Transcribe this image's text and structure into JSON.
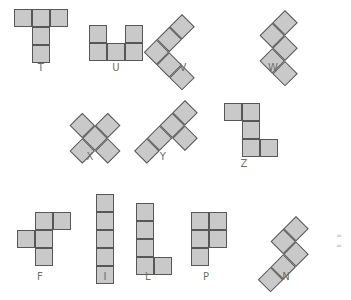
{
  "figure": {
    "title": "",
    "cell_size_px": 18,
    "colors": {
      "cell_fill": "#c9c9c9",
      "cell_stroke": "#575757",
      "label_text": "#6d6d6d",
      "background": "#ffffff",
      "mark": "#b9b9b9"
    }
  },
  "chart_data": {
    "type": "table",
    "title": "",
    "xlabel": "",
    "ylabel": "",
    "legend": [],
    "categories": [
      "T",
      "U",
      "V",
      "W",
      "X",
      "Y",
      "Z",
      "F",
      "I",
      "L",
      "P",
      "N"
    ],
    "values": [
      5,
      5,
      5,
      5,
      5,
      5,
      5,
      5,
      5,
      5,
      5,
      5
    ],
    "note": "each shape is made of 5 unit squares (pentomino); cells listed as grid [col,row]"
  },
  "rows": [
    {
      "row_index": 0,
      "pieces": [
        {
          "name": "T",
          "label": "T",
          "rotation_deg": 0,
          "origin": [
            14,
            9
          ],
          "label_pos": [
            21,
            63
          ],
          "cells": [
            [
              0,
              0
            ],
            [
              1,
              0
            ],
            [
              2,
              0
            ],
            [
              1,
              1
            ],
            [
              1,
              2
            ]
          ]
        },
        {
          "name": "U",
          "label": "U",
          "rotation_deg": 0,
          "origin": [
            89,
            25
          ],
          "label_pos": [
            96,
            63
          ],
          "cells": [
            [
              0,
              0
            ],
            [
              2,
              0
            ],
            [
              0,
              1
            ],
            [
              1,
              1
            ],
            [
              2,
              1
            ]
          ]
        },
        {
          "name": "V",
          "label": "V",
          "rotation_deg": 45,
          "origin": [
            182,
            14
          ],
          "label_pos": [
            163,
            63
          ],
          "cells": [
            [
              0,
              0
            ],
            [
              0,
              1
            ],
            [
              0,
              2
            ],
            [
              1,
              2
            ],
            [
              2,
              2
            ]
          ]
        },
        {
          "name": "W",
          "label": "W",
          "rotation_deg": 45,
          "origin": [
            285,
            10
          ],
          "label_pos": [
            253,
            63
          ],
          "cells": [
            [
              0,
              0
            ],
            [
              0,
              1
            ],
            [
              1,
              1
            ],
            [
              1,
              2
            ],
            [
              2,
              2
            ]
          ]
        }
      ]
    },
    {
      "row_index": 1,
      "pieces": [
        {
          "name": "X",
          "label": "X",
          "rotation_deg": 45,
          "origin": [
            95,
            100
          ],
          "label_pos": [
            70,
            152
          ],
          "cells": [
            [
              1,
              0
            ],
            [
              0,
              1
            ],
            [
              1,
              1
            ],
            [
              2,
              1
            ],
            [
              1,
              2
            ]
          ]
        },
        {
          "name": "Y",
          "label": "Y",
          "rotation_deg": 45,
          "origin": [
            185,
            100
          ],
          "label_pos": [
            143,
            152
          ],
          "cells": [
            [
              0,
              0
            ],
            [
              0,
              1
            ],
            [
              1,
              1
            ],
            [
              0,
              2
            ],
            [
              0,
              3
            ]
          ]
        },
        {
          "name": "Z",
          "label": "Z",
          "rotation_deg": 0,
          "origin": [
            224,
            103
          ],
          "label_pos": [
            224,
            159
          ],
          "cells": [
            [
              0,
              0
            ],
            [
              1,
              0
            ],
            [
              1,
              1
            ],
            [
              1,
              2
            ],
            [
              2,
              2
            ]
          ]
        }
      ]
    },
    {
      "row_index": 2,
      "pieces": [
        {
          "name": "F",
          "label": "F",
          "rotation_deg": 0,
          "origin": [
            17,
            212
          ],
          "label_pos": [
            20,
            272
          ],
          "cells": [
            [
              1,
              0
            ],
            [
              2,
              0
            ],
            [
              0,
              1
            ],
            [
              1,
              1
            ],
            [
              1,
              2
            ]
          ]
        },
        {
          "name": "I",
          "label": "I",
          "rotation_deg": 0,
          "origin": [
            96,
            194
          ],
          "label_pos": [
            85,
            272
          ],
          "cells": [
            [
              0,
              0
            ],
            [
              0,
              1
            ],
            [
              0,
              2
            ],
            [
              0,
              3
            ],
            [
              0,
              4
            ]
          ]
        },
        {
          "name": "L",
          "label": "L",
          "rotation_deg": 0,
          "origin": [
            136,
            203
          ],
          "label_pos": [
            128,
            272
          ],
          "cells": [
            [
              0,
              0
            ],
            [
              0,
              1
            ],
            [
              0,
              2
            ],
            [
              0,
              3
            ],
            [
              1,
              3
            ]
          ]
        },
        {
          "name": "P",
          "label": "P",
          "rotation_deg": 0,
          "origin": [
            191,
            212
          ],
          "label_pos": [
            186,
            272
          ],
          "cells": [
            [
              0,
              0
            ],
            [
              1,
              0
            ],
            [
              0,
              1
            ],
            [
              1,
              1
            ],
            [
              0,
              2
            ]
          ]
        },
        {
          "name": "N",
          "label": "N",
          "rotation_deg": 45,
          "origin": [
            296,
            216
          ],
          "label_pos": [
            266,
            272
          ],
          "cells": [
            [
              0,
              0
            ],
            [
              0,
              1
            ],
            [
              1,
              1
            ],
            [
              1,
              2
            ],
            [
              1,
              3
            ]
          ]
        }
      ]
    }
  ],
  "marks": [
    {
      "glyph": "≈",
      "pos": [
        336,
        233
      ]
    },
    {
      "glyph": "≈",
      "pos": [
        336,
        243
      ]
    }
  ]
}
